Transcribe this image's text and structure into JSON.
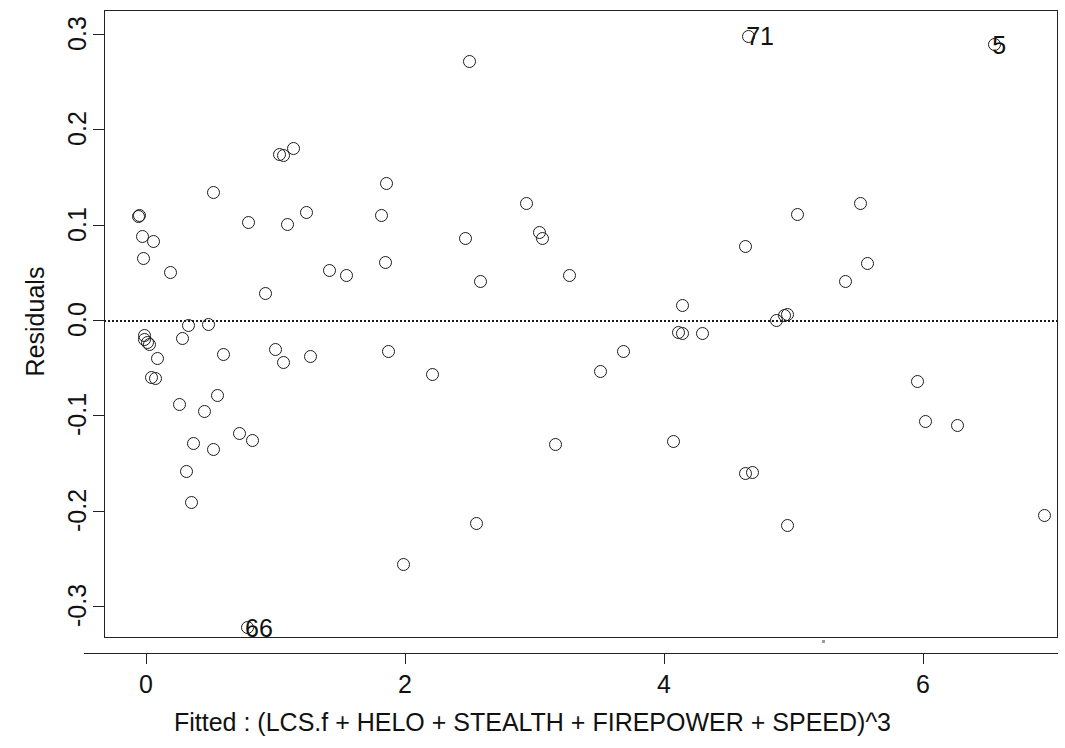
{
  "chart_data": {
    "type": "scatter",
    "title": "",
    "xlabel": "Fitted : (LCS.f + HELO + STEALTH + FIREPOWER + SPEED)^3",
    "ylabel": "Residuals",
    "xlim": [
      -0.35,
      7.05
    ],
    "ylim": [
      -0.335,
      0.335
    ],
    "xticks": [
      0,
      2,
      4,
      6
    ],
    "xticklabels": [
      "0",
      "2",
      "4",
      "6"
    ],
    "yticks": [
      0.3,
      0.2,
      0.1,
      0.0,
      -0.1,
      -0.2,
      -0.3
    ],
    "yticklabels": [
      "0.3",
      "0.2",
      "0.1",
      "0.0",
      "-0.1",
      "-0.2",
      "-0.3"
    ],
    "grid": false,
    "legend": null,
    "reference_line": {
      "y": 0.0,
      "style": "dotted",
      "color": "#1a1a1a"
    },
    "marker": {
      "shape": "circle",
      "filled": false,
      "color": "#1c1c1c",
      "size": 13
    },
    "annotations": [
      {
        "label": "71",
        "x": 4.65,
        "y": 0.298
      },
      {
        "label": "5",
        "x": 6.55,
        "y": 0.289
      },
      {
        "label": "66",
        "x": 0.78,
        "y": -0.323
      }
    ],
    "points": [
      {
        "x": -0.06,
        "y": 0.109
      },
      {
        "x": -0.05,
        "y": 0.11
      },
      {
        "x": -0.03,
        "y": 0.088
      },
      {
        "x": 0.06,
        "y": 0.082
      },
      {
        "x": -0.02,
        "y": 0.065
      },
      {
        "x": 0.19,
        "y": 0.05
      },
      {
        "x": 0.52,
        "y": 0.134
      },
      {
        "x": 0.79,
        "y": 0.102
      },
      {
        "x": 1.03,
        "y": 0.174
      },
      {
        "x": 1.06,
        "y": 0.173
      },
      {
        "x": 1.14,
        "y": 0.18
      },
      {
        "x": 1.09,
        "y": 0.1
      },
      {
        "x": 1.24,
        "y": 0.113
      },
      {
        "x": 1.42,
        "y": 0.052
      },
      {
        "x": 1.55,
        "y": 0.047
      },
      {
        "x": 1.86,
        "y": 0.143
      },
      {
        "x": 1.82,
        "y": 0.11
      },
      {
        "x": 1.85,
        "y": 0.06
      },
      {
        "x": 2.5,
        "y": 0.271
      },
      {
        "x": 2.47,
        "y": 0.085
      },
      {
        "x": 2.58,
        "y": 0.04
      },
      {
        "x": 2.94,
        "y": 0.122
      },
      {
        "x": 3.04,
        "y": 0.092
      },
      {
        "x": 3.06,
        "y": 0.086
      },
      {
        "x": 3.27,
        "y": 0.047
      },
      {
        "x": 4.14,
        "y": 0.015
      },
      {
        "x": 4.63,
        "y": 0.077
      },
      {
        "x": 5.03,
        "y": 0.111
      },
      {
        "x": 5.4,
        "y": 0.04
      },
      {
        "x": 5.52,
        "y": 0.122
      },
      {
        "x": 5.57,
        "y": 0.059
      },
      {
        "x": 0.92,
        "y": 0.028
      },
      {
        "x": 4.87,
        "y": 0.0
      },
      {
        "x": 4.93,
        "y": 0.005
      },
      {
        "x": 4.95,
        "y": 0.006
      },
      {
        "x": -0.01,
        "y": -0.016
      },
      {
        "x": -0.01,
        "y": -0.02
      },
      {
        "x": 0.01,
        "y": -0.024
      },
      {
        "x": 0.03,
        "y": -0.026
      },
      {
        "x": 0.09,
        "y": -0.04
      },
      {
        "x": 0.04,
        "y": -0.06
      },
      {
        "x": 0.07,
        "y": -0.061
      },
      {
        "x": 0.33,
        "y": -0.006
      },
      {
        "x": 0.28,
        "y": -0.019
      },
      {
        "x": 0.48,
        "y": -0.005
      },
      {
        "x": 0.6,
        "y": -0.036
      },
      {
        "x": 1.0,
        "y": -0.031
      },
      {
        "x": 1.06,
        "y": -0.045
      },
      {
        "x": 1.27,
        "y": -0.038
      },
      {
        "x": 1.87,
        "y": -0.033
      },
      {
        "x": 2.21,
        "y": -0.057
      },
      {
        "x": 3.51,
        "y": -0.054
      },
      {
        "x": 3.69,
        "y": -0.033
      },
      {
        "x": 4.11,
        "y": -0.013
      },
      {
        "x": 4.14,
        "y": -0.014
      },
      {
        "x": 4.3,
        "y": -0.014
      },
      {
        "x": 0.26,
        "y": -0.089
      },
      {
        "x": 0.37,
        "y": -0.13
      },
      {
        "x": 0.45,
        "y": -0.096
      },
      {
        "x": 0.55,
        "y": -0.079
      },
      {
        "x": 0.52,
        "y": -0.136
      },
      {
        "x": 0.72,
        "y": -0.119
      },
      {
        "x": 0.82,
        "y": -0.126
      },
      {
        "x": 0.31,
        "y": -0.159
      },
      {
        "x": 0.35,
        "y": -0.192
      },
      {
        "x": 2.55,
        "y": -0.214
      },
      {
        "x": 1.99,
        "y": -0.257
      },
      {
        "x": 3.16,
        "y": -0.131
      },
      {
        "x": 4.07,
        "y": -0.128
      },
      {
        "x": 4.63,
        "y": -0.161
      },
      {
        "x": 4.68,
        "y": -0.16
      },
      {
        "x": 4.95,
        "y": -0.216
      },
      {
        "x": 5.96,
        "y": -0.065
      },
      {
        "x": 6.02,
        "y": -0.107
      },
      {
        "x": 6.27,
        "y": -0.111
      },
      {
        "x": 6.94,
        "y": -0.205
      }
    ]
  },
  "axes": {
    "ylabel": "Residuals",
    "xlabel": "Fitted : (LCS.f + HELO + STEALTH + FIREPOWER + SPEED)^3"
  }
}
